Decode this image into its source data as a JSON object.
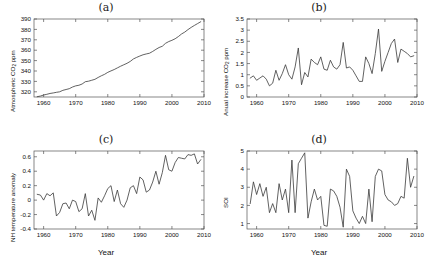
{
  "figure": {
    "background": "#ffffff",
    "line_color": "#3a3a3a",
    "axis_color": "#555555"
  },
  "panels": [
    {
      "id": "a",
      "title": "(a)",
      "ylabel_main": "Atmospheric CO",
      "ylabel_sub": "2",
      "ylabel_tail": " ppm",
      "xlabel": "",
      "yticks": [
        "320",
        "330",
        "340",
        "350",
        "360",
        "370",
        "380",
        "390"
      ],
      "xticks": [
        "1960",
        "1970",
        "1980",
        "1990",
        "2000",
        "2010"
      ]
    },
    {
      "id": "b",
      "title": "(b)",
      "ylabel_main": "Anual increase CO",
      "ylabel_sub": "2",
      "ylabel_tail": " ppm",
      "xlabel": "",
      "yticks": [
        "0",
        "0.5",
        "1",
        "1.5",
        "2",
        "2.5",
        "3",
        "3.5"
      ],
      "xticks": [
        "1960",
        "1970",
        "1980",
        "1990",
        "2000",
        "2010"
      ]
    },
    {
      "id": "c",
      "title": "(c)",
      "ylabel_main": "NH temperature anomaly",
      "ylabel_sub": "",
      "ylabel_tail": "",
      "xlabel": "Year",
      "yticks": [
        "-0.4",
        "-0.2",
        "0",
        "0.2",
        "0.4",
        "0.6"
      ],
      "xticks": [
        "1960",
        "1970",
        "1980",
        "1990",
        "2000",
        "2010"
      ]
    },
    {
      "id": "d",
      "title": "(d)",
      "ylabel_main": "SOI",
      "ylabel_sub": "",
      "ylabel_tail": "",
      "xlabel": "Year",
      "yticks": [
        "1",
        "2",
        "3",
        "4",
        "5"
      ],
      "xticks": [
        "1960",
        "1970",
        "1980",
        "1990",
        "2000",
        "2010"
      ]
    }
  ],
  "chart_data": [
    {
      "type": "line",
      "panel": "a",
      "title": "(a)",
      "xlabel": "",
      "ylabel": "Atmospheric CO2 ppm",
      "xlim": [
        1957,
        2010
      ],
      "ylim": [
        315,
        390
      ],
      "xticks": [
        1960,
        1970,
        1980,
        1990,
        2000,
        2010
      ],
      "yticks": [
        320,
        330,
        340,
        350,
        360,
        370,
        380,
        390
      ],
      "grid": false,
      "legend": "none",
      "x": [
        1958,
        1959,
        1960,
        1961,
        1962,
        1963,
        1964,
        1965,
        1966,
        1967,
        1968,
        1969,
        1970,
        1971,
        1972,
        1973,
        1974,
        1975,
        1976,
        1977,
        1978,
        1979,
        1980,
        1981,
        1982,
        1983,
        1984,
        1985,
        1986,
        1987,
        1988,
        1989,
        1990,
        1991,
        1992,
        1993,
        1994,
        1995,
        1996,
        1997,
        1998,
        1999,
        2000,
        2001,
        2002,
        2003,
        2004,
        2005,
        2006,
        2007,
        2008,
        2009
      ],
      "values": [
        315.3,
        315.9,
        316.9,
        317.6,
        318.4,
        318.9,
        319.5,
        320.0,
        321.4,
        322.2,
        323.0,
        324.6,
        325.7,
        326.3,
        327.5,
        329.7,
        330.2,
        331.1,
        332.0,
        333.8,
        335.4,
        336.8,
        338.7,
        340.1,
        341.4,
        343.0,
        344.6,
        346.0,
        347.4,
        349.2,
        351.6,
        353.1,
        354.4,
        355.6,
        356.4,
        357.1,
        358.8,
        360.8,
        362.6,
        363.8,
        366.6,
        368.3,
        369.5,
        371.0,
        373.1,
        375.6,
        377.4,
        379.8,
        381.9,
        383.8,
        385.6,
        387.4
      ]
    },
    {
      "type": "line",
      "panel": "b",
      "title": "(b)",
      "xlabel": "",
      "ylabel": "Anual increase CO2 ppm",
      "xlim": [
        1957,
        2010
      ],
      "ylim": [
        0,
        3.5
      ],
      "xticks": [
        1960,
        1970,
        1980,
        1990,
        2000,
        2010
      ],
      "yticks": [
        0,
        0.5,
        1,
        1.5,
        2,
        2.5,
        3,
        3.5
      ],
      "grid": false,
      "legend": "none",
      "x": [
        1958,
        1959,
        1960,
        1961,
        1962,
        1963,
        1964,
        1965,
        1966,
        1967,
        1968,
        1969,
        1970,
        1971,
        1972,
        1973,
        1974,
        1975,
        1976,
        1977,
        1978,
        1979,
        1980,
        1981,
        1982,
        1983,
        1984,
        1985,
        1986,
        1987,
        1988,
        1989,
        1990,
        1991,
        1992,
        1993,
        1994,
        1995,
        1996,
        1997,
        1998,
        1999,
        2000,
        2001,
        2002,
        2003,
        2004,
        2005,
        2006,
        2007,
        2008,
        2009
      ],
      "values": [
        0.85,
        0.95,
        0.75,
        0.85,
        0.95,
        0.8,
        0.5,
        0.62,
        1.2,
        0.75,
        1.05,
        1.45,
        1.0,
        0.8,
        1.35,
        2.2,
        0.55,
        1.1,
        0.9,
        1.7,
        1.55,
        1.45,
        1.8,
        1.25,
        1.2,
        1.65,
        1.35,
        1.25,
        1.45,
        2.45,
        1.3,
        1.35,
        1.2,
        0.95,
        0.7,
        0.7,
        1.8,
        1.5,
        1.05,
        1.95,
        3.05,
        1.15,
        1.6,
        2.0,
        2.4,
        2.6,
        1.55,
        2.15,
        2.05,
        1.95,
        1.8,
        1.85
      ]
    },
    {
      "type": "line",
      "panel": "c",
      "title": "(c)",
      "xlabel": "Year",
      "ylabel": "NH temperature anomaly",
      "xlim": [
        1957,
        2010
      ],
      "ylim": [
        -0.4,
        0.68
      ],
      "xticks": [
        1960,
        1970,
        1980,
        1990,
        2000,
        2010
      ],
      "yticks": [
        -0.4,
        -0.2,
        0,
        0.2,
        0.4,
        0.6
      ],
      "grid": false,
      "legend": "none",
      "x": [
        1958,
        1959,
        1960,
        1961,
        1962,
        1963,
        1964,
        1965,
        1966,
        1967,
        1968,
        1969,
        1970,
        1971,
        1972,
        1973,
        1974,
        1975,
        1976,
        1977,
        1978,
        1979,
        1980,
        1981,
        1982,
        1983,
        1984,
        1985,
        1986,
        1987,
        1988,
        1989,
        1990,
        1991,
        1992,
        1993,
        1994,
        1995,
        1996,
        1997,
        1998,
        1999,
        2000,
        2001,
        2002,
        2003,
        2004,
        2005,
        2006,
        2007,
        2008,
        2009
      ],
      "values": [
        0.08,
        0.07,
        0.0,
        0.09,
        0.06,
        0.1,
        -0.22,
        -0.17,
        -0.05,
        -0.04,
        -0.12,
        0.0,
        -0.02,
        -0.16,
        -0.12,
        0.09,
        -0.22,
        -0.14,
        -0.28,
        0.03,
        -0.03,
        0.06,
        0.16,
        0.2,
        -0.02,
        0.14,
        -0.05,
        -0.1,
        0.0,
        0.17,
        0.2,
        0.09,
        0.32,
        0.28,
        0.11,
        0.14,
        0.25,
        0.4,
        0.22,
        0.38,
        0.62,
        0.42,
        0.4,
        0.52,
        0.59,
        0.58,
        0.57,
        0.63,
        0.62,
        0.64,
        0.5,
        0.56
      ]
    },
    {
      "type": "line",
      "panel": "d",
      "title": "(d)",
      "xlabel": "Year",
      "ylabel": "SOI",
      "xlim": [
        1957,
        2010
      ],
      "ylim": [
        0.7,
        5.0
      ],
      "xticks": [
        1960,
        1970,
        1980,
        1990,
        2000,
        2010
      ],
      "yticks": [
        1,
        2,
        3,
        4,
        5
      ],
      "grid": false,
      "legend": "none",
      "x": [
        1958,
        1959,
        1960,
        1961,
        1962,
        1963,
        1964,
        1965,
        1966,
        1967,
        1968,
        1969,
        1970,
        1971,
        1972,
        1973,
        1974,
        1975,
        1976,
        1977,
        1978,
        1979,
        1980,
        1981,
        1982,
        1983,
        1984,
        1985,
        1986,
        1987,
        1988,
        1989,
        1990,
        1991,
        1992,
        1993,
        1994,
        1995,
        1996,
        1997,
        1998,
        1999,
        2000,
        2001,
        2002,
        2003,
        2004,
        2005,
        2006,
        2007,
        2008,
        2009
      ],
      "values": [
        2.1,
        3.3,
        2.6,
        3.2,
        2.5,
        3.0,
        1.6,
        2.1,
        1.6,
        3.2,
        2.3,
        2.9,
        1.6,
        4.5,
        1.6,
        4.3,
        4.6,
        4.9,
        1.3,
        2.2,
        2.9,
        2.3,
        2.5,
        0.9,
        0.85,
        2.9,
        2.8,
        2.5,
        1.9,
        0.8,
        4.0,
        3.6,
        1.7,
        1.3,
        1.0,
        1.4,
        1.0,
        2.9,
        1.1,
        3.6,
        4.0,
        3.9,
        2.6,
        2.3,
        2.2,
        2.0,
        2.1,
        2.5,
        2.4,
        4.6,
        3.0,
        3.6
      ]
    }
  ]
}
